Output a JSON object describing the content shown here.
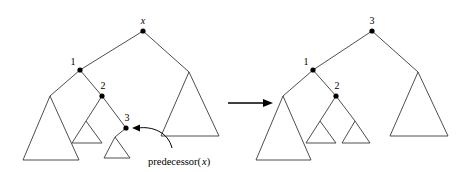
{
  "figure": {
    "background_color": "#ffffff",
    "line_color": "#3a3a3a",
    "node_color": "#000000",
    "annotation": {
      "text_main": "predecessor(",
      "text_italic": "x",
      "text_close": ")"
    },
    "transition_arrow": {
      "name": "transforms-to"
    },
    "left_tree": {
      "name": "before",
      "root_label": "x",
      "root_label_style": "italic",
      "node_labels": [
        "1",
        "2",
        "3"
      ],
      "nodes": [
        {
          "label": "x",
          "italic": true,
          "x": 143,
          "y": 31,
          "label_dx": 0,
          "label_dy": -7
        },
        {
          "label": "1",
          "italic": false,
          "x": 80,
          "y": 70,
          "label_dx": -7,
          "label_dy": -5
        },
        {
          "label": "2",
          "italic": false,
          "x": 102,
          "y": 96,
          "label_dx": 1,
          "label_dy": -7
        },
        {
          "label": "3",
          "italic": false,
          "x": 126,
          "y": 128,
          "label_dx": 1,
          "label_dy": -7
        }
      ],
      "edges": [
        {
          "from": "x",
          "to": "1"
        },
        {
          "from": "x",
          "to": "right-subtree"
        },
        {
          "from": "1",
          "to": "left-subtree"
        },
        {
          "from": "1",
          "to": "2"
        },
        {
          "from": "2",
          "to": "small-subtree"
        },
        {
          "from": "2",
          "to": "3"
        },
        {
          "from": "3",
          "to": "leaf-subtree"
        }
      ],
      "subtrees": [
        {
          "name": "left-large-subtree",
          "apex_x": 50,
          "apex_y": 96,
          "left_x": 23,
          "right_x": 79,
          "base_y": 160
        },
        {
          "name": "middle-small-subtree",
          "apex_x": 86,
          "apex_y": 121,
          "left_x": 72,
          "right_x": 102,
          "base_y": 143
        },
        {
          "name": "leaf-small-subtree",
          "apex_x": 115,
          "apex_y": 137,
          "left_x": 104,
          "right_x": 130,
          "base_y": 158
        },
        {
          "name": "right-large-subtree",
          "apex_x": 189,
          "apex_y": 72,
          "left_x": 161,
          "right_x": 219,
          "base_y": 136
        }
      ]
    },
    "right_tree": {
      "name": "after",
      "root_label": "3",
      "root_label_style": "upright",
      "node_labels": [
        "3",
        "1",
        "2"
      ],
      "nodes": [
        {
          "label": "3",
          "italic": false,
          "x": 372,
          "y": 31,
          "label_dx": 0,
          "label_dy": -7
        },
        {
          "label": "1",
          "italic": false,
          "x": 313,
          "y": 70,
          "label_dx": -7,
          "label_dy": -5
        },
        {
          "label": "2",
          "italic": false,
          "x": 336,
          "y": 96,
          "label_dx": 1,
          "label_dy": -7
        }
      ],
      "edges": [
        {
          "from": "3",
          "to": "1"
        },
        {
          "from": "3",
          "to": "right-subtree"
        },
        {
          "from": "1",
          "to": "left-subtree"
        },
        {
          "from": "1",
          "to": "2"
        },
        {
          "from": "2",
          "to": "small-subtree-a"
        },
        {
          "from": "2",
          "to": "small-subtree-b"
        }
      ],
      "subtrees": [
        {
          "name": "left-large-subtree",
          "apex_x": 283,
          "apex_y": 96,
          "left_x": 256,
          "right_x": 311,
          "base_y": 160
        },
        {
          "name": "middle-small-subtree",
          "apex_x": 320,
          "apex_y": 121,
          "left_x": 306,
          "right_x": 336,
          "base_y": 143
        },
        {
          "name": "second-small-subtree",
          "apex_x": 355,
          "apex_y": 121,
          "left_x": 342,
          "right_x": 370,
          "base_y": 143
        },
        {
          "name": "right-large-subtree",
          "apex_x": 418,
          "apex_y": 72,
          "left_x": 390,
          "right_x": 448,
          "base_y": 136
        }
      ]
    }
  }
}
